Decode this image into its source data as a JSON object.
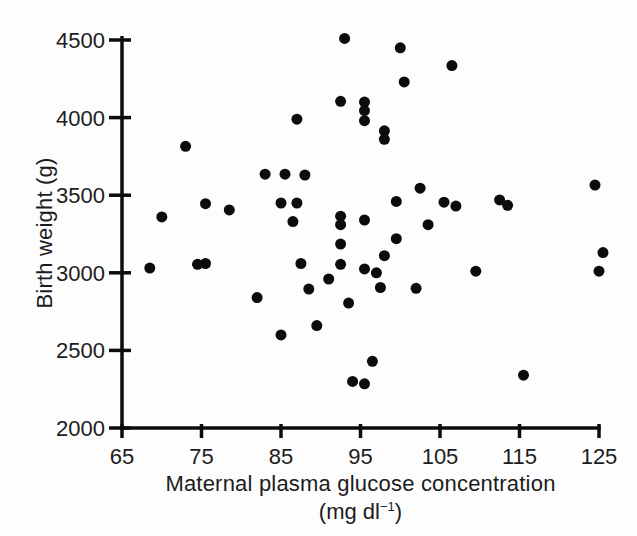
{
  "figure": {
    "background": "#fdfdfd",
    "ink": "#0c0c0c",
    "text_color": "#1c1c1c"
  },
  "chart_data": {
    "type": "scatter",
    "title": "",
    "xlabel_line1": "Maternal plasma glucose concentration",
    "xlabel_unit_prefix": "(mg dl",
    "xlabel_unit_exponent": "−1",
    "xlabel_unit_suffix": ")",
    "ylabel": "Birth weight (g)",
    "xlabel_full": "Maternal plasma glucose concentration (mg dl⁻¹)",
    "xlim": [
      65,
      125
    ],
    "ylim": [
      2000,
      4500
    ],
    "x_ticks": [
      65,
      75,
      85,
      95,
      105,
      115,
      125
    ],
    "y_ticks": [
      2000,
      2500,
      3000,
      3500,
      4000,
      4500
    ],
    "grid": false,
    "marker": {
      "shape": "filled-circle",
      "diameter_px": 11,
      "color": "#0c0c0c"
    },
    "points": [
      [
        93,
        4510
      ],
      [
        100,
        4450
      ],
      [
        106.5,
        4335
      ],
      [
        100.5,
        4230
      ],
      [
        92.5,
        4105
      ],
      [
        95.5,
        4100
      ],
      [
        95.5,
        4045
      ],
      [
        95.5,
        3980
      ],
      [
        87,
        3990
      ],
      [
        98,
        3915
      ],
      [
        98,
        3860
      ],
      [
        73,
        3815
      ],
      [
        83,
        3635
      ],
      [
        85.5,
        3635
      ],
      [
        88,
        3630
      ],
      [
        124.5,
        3565
      ],
      [
        102.5,
        3545
      ],
      [
        112.5,
        3470
      ],
      [
        99.5,
        3460
      ],
      [
        105.5,
        3455
      ],
      [
        85,
        3450
      ],
      [
        87,
        3450
      ],
      [
        75.5,
        3445
      ],
      [
        113.5,
        3435
      ],
      [
        107,
        3430
      ],
      [
        78.5,
        3405
      ],
      [
        70,
        3360
      ],
      [
        92.5,
        3365
      ],
      [
        95.5,
        3340
      ],
      [
        86.5,
        3330
      ],
      [
        92.5,
        3310
      ],
      [
        103.5,
        3310
      ],
      [
        99.5,
        3220
      ],
      [
        92.5,
        3185
      ],
      [
        125.5,
        3130
      ],
      [
        98,
        3110
      ],
      [
        87.5,
        3060
      ],
      [
        75.5,
        3060
      ],
      [
        74.5,
        3055
      ],
      [
        92.5,
        3055
      ],
      [
        95.5,
        3025
      ],
      [
        68.5,
        3030
      ],
      [
        109.5,
        3010
      ],
      [
        125,
        3010
      ],
      [
        97,
        3000
      ],
      [
        91,
        2960
      ],
      [
        97.5,
        2905
      ],
      [
        88.5,
        2895
      ],
      [
        102,
        2900
      ],
      [
        82,
        2840
      ],
      [
        93.5,
        2805
      ],
      [
        89.5,
        2660
      ],
      [
        85,
        2600
      ],
      [
        96.5,
        2430
      ],
      [
        115.5,
        2340
      ],
      [
        94,
        2300
      ],
      [
        95.5,
        2285
      ]
    ]
  }
}
